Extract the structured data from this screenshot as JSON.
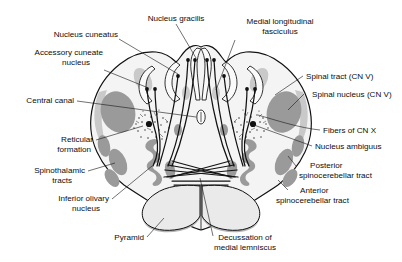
{
  "figure": {
    "background_color": "#ffffff",
    "text_color": "#0d0d0d",
    "leader_color": "#1a1a1a"
  },
  "labels": {
    "nucleus_gracilis": "Nucleus gracilis",
    "nucleus_cuneatus": "Nucleus cuneatus",
    "accessory_cuneate_1": "Accessory cuneate",
    "accessory_cuneate_2": "nucleus",
    "central_canal": "Central canal",
    "medial_longitudinal_1": "Medial longitudinal",
    "medial_longitudinal_2": "fasciculus",
    "spinal_tract": "Spinal tract (CN V)",
    "spinal_nucleus": "Spinal nucleus (CN V)",
    "fibers_cn_x": "Fibers of CN X",
    "nucleus_ambiguus": "Nucleus ambiguus",
    "posterior_spino_1": "Posterior",
    "posterior_spino_2": "spinocerebellar tract",
    "anterior_spino_1": "Anterior",
    "anterior_spino_2": "spinocerebellar tract",
    "reticular_1": "Reticular",
    "reticular_2": "formation",
    "spinothalamic_1": "Spinothalamic",
    "spinothalamic_2": "tracts",
    "inferior_olivary_1": "Inferior olivary",
    "inferior_olivary_2": "nucleus",
    "pyramid": "Pyramid",
    "decussation_1": "Decussation of",
    "decussation_2": "medial lemniscus"
  },
  "structures": [
    {
      "name": "medulla-outline",
      "shade": "#f4f4f4"
    },
    {
      "name": "nucleus-gracilis",
      "side": "both",
      "shade": "#fafafa"
    },
    {
      "name": "nucleus-cuneatus",
      "side": "both",
      "shade": "#fafafa"
    },
    {
      "name": "accessory-cuneate-nucleus",
      "side": "both",
      "shade": "#c9c9c9"
    },
    {
      "name": "spinal-tract-cn-v",
      "side": "both",
      "shade": "#c9c9c9"
    },
    {
      "name": "spinal-nucleus-cn-v",
      "side": "both",
      "shade": "#9a9a9a"
    },
    {
      "name": "central-canal",
      "side": "midline",
      "shade": "#fafafa"
    },
    {
      "name": "reticular-formation",
      "side": "both",
      "shade": "stipple"
    },
    {
      "name": "nucleus-ambiguus",
      "side": "both",
      "shade": "#101010"
    },
    {
      "name": "spinothalamic-tracts",
      "side": "both",
      "shade": "#9a9a9a"
    },
    {
      "name": "inferior-olivary-nucleus",
      "side": "both",
      "shade": "#9a9a9a"
    },
    {
      "name": "posterior-spinocerebellar-tract",
      "side": "both",
      "shade": "#9a9a9a"
    },
    {
      "name": "anterior-spinocerebellar-tract",
      "side": "both",
      "shade": "#9a9a9a"
    },
    {
      "name": "pyramid",
      "side": "both",
      "shade": "#eaeaea"
    },
    {
      "name": "decussation-of-medial-lemniscus",
      "side": "midline",
      "shade": "#121212"
    },
    {
      "name": "medial-longitudinal-fasciculus",
      "side": "both",
      "shade": "#c9c9c9"
    }
  ]
}
